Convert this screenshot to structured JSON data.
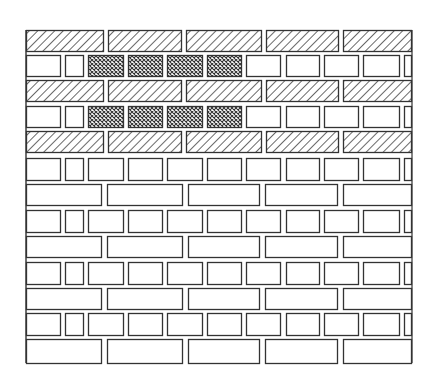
{
  "figure": {
    "type": "brick-bond-elevation",
    "stroke_color": "#333333",
    "background_color": "#ffffff",
    "frame": {
      "left": 26,
      "top": 30,
      "right": 412,
      "bottom": 363
    },
    "legend_fills": {
      "hatched": "diagonal-hatch",
      "crosshatch": "crosshatch",
      "plain": "plain"
    },
    "rows": [
      {
        "kind": "stretcher",
        "fill": "hatched",
        "y": 30,
        "h": 21,
        "bricks": [
          [
            26,
            104
          ],
          [
            108,
            182
          ],
          [
            186,
            262
          ],
          [
            266,
            339
          ],
          [
            343,
            412
          ]
        ]
      },
      {
        "kind": "header",
        "fill": "mixed",
        "y": 55,
        "h": 21,
        "bricks": [
          [
            26,
            61,
            "plain"
          ],
          [
            65,
            84,
            "plain"
          ],
          [
            88,
            124,
            "crosshatch"
          ],
          [
            128,
            163,
            "crosshatch"
          ],
          [
            167,
            203,
            "crosshatch"
          ],
          [
            207,
            242,
            "crosshatch"
          ],
          [
            246,
            281,
            "plain"
          ],
          [
            286,
            320,
            "plain"
          ],
          [
            324,
            359,
            "plain"
          ],
          [
            363,
            400,
            "plain"
          ],
          [
            404,
            412,
            "plain"
          ]
        ]
      },
      {
        "kind": "stretcher",
        "fill": "hatched",
        "y": 80,
        "h": 21,
        "bricks": [
          [
            26,
            104
          ],
          [
            108,
            182
          ],
          [
            186,
            262
          ],
          [
            266,
            339
          ],
          [
            343,
            412
          ]
        ]
      },
      {
        "kind": "header",
        "fill": "mixed",
        "y": 106,
        "h": 21,
        "bricks": [
          [
            26,
            61,
            "plain"
          ],
          [
            65,
            84,
            "plain"
          ],
          [
            88,
            124,
            "crosshatch"
          ],
          [
            128,
            163,
            "crosshatch"
          ],
          [
            167,
            203,
            "crosshatch"
          ],
          [
            207,
            242,
            "crosshatch"
          ],
          [
            246,
            281,
            "plain"
          ],
          [
            286,
            320,
            "plain"
          ],
          [
            324,
            359,
            "plain"
          ],
          [
            363,
            400,
            "plain"
          ],
          [
            404,
            412,
            "plain"
          ]
        ]
      },
      {
        "kind": "stretcher",
        "fill": "hatched",
        "y": 131,
        "h": 21,
        "bricks": [
          [
            26,
            104
          ],
          [
            108,
            182
          ],
          [
            186,
            262
          ],
          [
            266,
            339
          ],
          [
            343,
            412
          ]
        ]
      },
      {
        "kind": "header",
        "fill": "plain",
        "y": 158,
        "h": 22,
        "bricks": [
          [
            26,
            61
          ],
          [
            65,
            84
          ],
          [
            88,
            124
          ],
          [
            128,
            163
          ],
          [
            167,
            203
          ],
          [
            207,
            242
          ],
          [
            246,
            281
          ],
          [
            286,
            320
          ],
          [
            324,
            359
          ],
          [
            363,
            400
          ],
          [
            404,
            412
          ]
        ]
      },
      {
        "kind": "stretcher",
        "fill": "plain",
        "y": 184,
        "h": 21,
        "bricks": [
          [
            26,
            102
          ],
          [
            107,
            183
          ],
          [
            188,
            260
          ],
          [
            265,
            338
          ],
          [
            343,
            412
          ]
        ]
      },
      {
        "kind": "header",
        "fill": "plain",
        "y": 210,
        "h": 22,
        "bricks": [
          [
            26,
            61
          ],
          [
            65,
            84
          ],
          [
            88,
            124
          ],
          [
            128,
            163
          ],
          [
            167,
            203
          ],
          [
            207,
            242
          ],
          [
            246,
            281
          ],
          [
            286,
            320
          ],
          [
            324,
            359
          ],
          [
            363,
            400
          ],
          [
            404,
            412
          ]
        ]
      },
      {
        "kind": "stretcher",
        "fill": "plain",
        "y": 236,
        "h": 21,
        "bricks": [
          [
            26,
            102
          ],
          [
            107,
            183
          ],
          [
            188,
            260
          ],
          [
            265,
            338
          ],
          [
            343,
            412
          ]
        ]
      },
      {
        "kind": "header",
        "fill": "plain",
        "y": 262,
        "h": 22,
        "bricks": [
          [
            26,
            61
          ],
          [
            65,
            84
          ],
          [
            88,
            124
          ],
          [
            128,
            163
          ],
          [
            167,
            203
          ],
          [
            207,
            242
          ],
          [
            246,
            281
          ],
          [
            286,
            320
          ],
          [
            324,
            359
          ],
          [
            363,
            400
          ],
          [
            404,
            412
          ]
        ]
      },
      {
        "kind": "stretcher",
        "fill": "plain",
        "y": 288,
        "h": 21,
        "bricks": [
          [
            26,
            102
          ],
          [
            107,
            183
          ],
          [
            188,
            260
          ],
          [
            265,
            338
          ],
          [
            343,
            412
          ]
        ]
      },
      {
        "kind": "header",
        "fill": "plain",
        "y": 313,
        "h": 22,
        "bricks": [
          [
            26,
            61
          ],
          [
            65,
            84
          ],
          [
            88,
            124
          ],
          [
            128,
            163
          ],
          [
            167,
            203
          ],
          [
            207,
            242
          ],
          [
            246,
            281
          ],
          [
            286,
            320
          ],
          [
            324,
            359
          ],
          [
            363,
            400
          ],
          [
            404,
            412
          ]
        ]
      },
      {
        "kind": "stretcher",
        "fill": "plain",
        "y": 339,
        "h": 24,
        "bricks": [
          [
            26,
            102
          ],
          [
            107,
            183
          ],
          [
            188,
            260
          ],
          [
            265,
            338
          ],
          [
            343,
            412
          ]
        ]
      }
    ]
  },
  "caption": {
    "text": ""
  }
}
